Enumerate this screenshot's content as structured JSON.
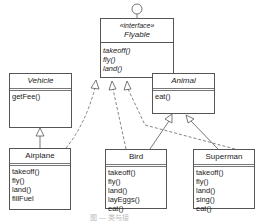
{
  "diagram": {
    "interface": {
      "stereotype": "«interface»",
      "name": "Flyable",
      "operations": [
        "takeoff()",
        "fly()",
        "land()"
      ]
    },
    "classes": {
      "vehicle": {
        "name": "Vehicle",
        "operations": [
          "getFee()"
        ]
      },
      "animal": {
        "name": "Animal",
        "operations": [
          "eat()"
        ]
      },
      "airplane": {
        "name": "Airplane",
        "operations": [
          "takeoff()",
          "fly()",
          "land()",
          "fillFuel"
        ]
      },
      "bird": {
        "name": "Bird",
        "operations": [
          "takeoff()",
          "fly()",
          "land()",
          "layEggs()",
          "eat()"
        ]
      },
      "superman": {
        "name": "Superman",
        "operations": [
          "takeoff()",
          "fly()",
          "land()",
          "sing()",
          "eat()"
        ]
      }
    },
    "relations": [
      {
        "from": "Airplane",
        "to": "Vehicle",
        "type": "generalization"
      },
      {
        "from": "Airplane",
        "to": "Flyable",
        "type": "realization"
      },
      {
        "from": "Bird",
        "to": "Flyable",
        "type": "realization"
      },
      {
        "from": "Bird",
        "to": "Animal",
        "type": "generalization"
      },
      {
        "from": "Superman",
        "to": "Flyable",
        "type": "realization"
      },
      {
        "from": "Superman",
        "to": "Animal",
        "type": "generalization"
      }
    ],
    "caption": "图 — 类与接"
  }
}
